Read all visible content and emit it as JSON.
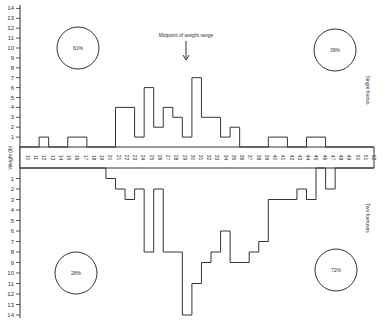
{
  "chart_data": {
    "type": "bar",
    "title": "",
    "xlabel": "Weight (lb)",
    "ylabel": "",
    "ylim_upper": [
      0,
      14
    ],
    "ylim_lower": [
      0,
      14
    ],
    "x_tick_labels": [
      "10",
      "11",
      "12",
      "13",
      "14",
      "15",
      "16",
      "17",
      "18",
      "19",
      "20",
      "21",
      "22",
      "23",
      "24",
      "25",
      "26",
      "27",
      "28",
      "29",
      "30",
      "31",
      "32",
      "33",
      "34",
      "35",
      "36",
      "37",
      "38",
      "39",
      "40",
      "41",
      "42",
      "43",
      "44",
      "45",
      "46",
      "47",
      "48",
      "49",
      "50",
      "51",
      "52"
    ],
    "y_ticks": [
      1,
      2,
      3,
      4,
      5,
      6,
      7,
      8,
      9,
      10,
      11,
      12,
      13,
      14
    ],
    "column_count": 37,
    "series": [
      {
        "name": "Single foetus",
        "direction": "up",
        "values": [
          0,
          0,
          1,
          0,
          0,
          1,
          1,
          0,
          0,
          0,
          4,
          4,
          1,
          6,
          2,
          4,
          3,
          1,
          7,
          3,
          3,
          1,
          2,
          0,
          0,
          0,
          1,
          1,
          0,
          0,
          1,
          1,
          0,
          0,
          0,
          0,
          0
        ]
      },
      {
        "name": "Two foetuses",
        "direction": "down",
        "values": [
          0,
          0,
          0,
          0,
          0,
          0,
          0,
          0,
          0,
          1,
          2,
          3,
          2,
          8,
          2,
          8,
          8,
          14,
          11,
          9,
          8,
          6,
          9,
          9,
          8,
          7,
          3,
          3,
          3,
          2,
          3,
          0,
          2,
          0,
          0,
          0,
          0
        ]
      }
    ],
    "annotations": [
      {
        "text": "Midpoint of weight range",
        "arrow": true
      },
      {
        "text": "61%",
        "quadrant": "upper-left"
      },
      {
        "text": "39%",
        "quadrant": "upper-right"
      },
      {
        "text": "28%",
        "quadrant": "lower-left"
      },
      {
        "text": "72%",
        "quadrant": "lower-right"
      }
    ],
    "side_labels": [
      "Single foetus",
      "Two foetuses"
    ],
    "grid": false
  },
  "labels": {
    "midpoint": "Midpoint of weight range",
    "single": "Single foetus",
    "two": "Two foetuses",
    "axis": "Weight (lb)",
    "pct_ul": "61%",
    "pct_ur": "39%",
    "pct_ll": "28%",
    "pct_lr": "72%"
  }
}
